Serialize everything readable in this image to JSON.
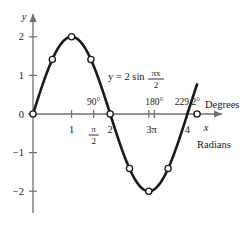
{
  "chart_data": {
    "type": "line",
    "title": "",
    "equation_label": "y = 2 sin",
    "equation_numerator": "πx",
    "equation_denominator": "2",
    "function": "y = 2 sin(πx/2)",
    "xlabel": "x",
    "ylabel": "y",
    "xlim": [
      -0.35,
      4.9
    ],
    "ylim": [
      -2.75,
      2.6
    ],
    "grid": false,
    "legend": "none",
    "x": [
      0,
      0.5,
      1,
      1.5,
      2,
      2.5,
      3,
      3.5,
      4
    ],
    "values": [
      0,
      1.41,
      2,
      1.41,
      0,
      -1.41,
      -2,
      -1.41,
      0
    ],
    "marked_points": [
      {
        "x": 0,
        "y": 0
      },
      {
        "x": 0.5,
        "y": 1.41
      },
      {
        "x": 1,
        "y": 2
      },
      {
        "x": 1.5,
        "y": 1.41
      },
      {
        "x": 2,
        "y": 0
      },
      {
        "x": 2.5,
        "y": -1.41
      },
      {
        "x": 3,
        "y": -2
      },
      {
        "x": 3.5,
        "y": -1.41
      },
      {
        "x": 4.25,
        "y": 0
      }
    ],
    "curve_x_start": 0,
    "curve_x_end": 4.25,
    "x_ticks": [
      {
        "x": 1,
        "label": "1"
      },
      {
        "x": 1.571,
        "label": "π/2",
        "is_fraction": true,
        "numerator": "π",
        "denominator": "2"
      },
      {
        "x": 2,
        "label": "2"
      },
      {
        "x": 3,
        "label": "3"
      },
      {
        "x": 3.1416,
        "label": "π"
      },
      {
        "x": 4,
        "label": "4"
      }
    ],
    "y_ticks": [
      {
        "y": 2,
        "label": "2"
      },
      {
        "y": 1,
        "label": "1"
      },
      {
        "y": 0,
        "label": "0"
      },
      {
        "y": -1,
        "label": "−1"
      },
      {
        "y": -2,
        "label": "−2"
      }
    ],
    "degree_labels": [
      {
        "x": 1.571,
        "label": "90°"
      },
      {
        "x": 3.1416,
        "label": "180°"
      },
      {
        "x": 4.0,
        "label": "229.2°"
      }
    ],
    "unit_labels": {
      "degrees": "Degrees",
      "radians": "Radians"
    },
    "colors": {
      "curve": "#1a1a1a",
      "axis": "#6e6e6e",
      "marker_fill": "#ffffff",
      "background": "#ffffff"
    }
  }
}
